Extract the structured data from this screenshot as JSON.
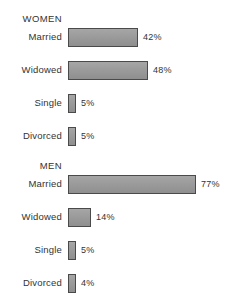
{
  "chart_data": {
    "type": "bar",
    "orientation": "horizontal",
    "title": "",
    "xlabel": "",
    "ylabel": "",
    "xlim": [
      0,
      100
    ],
    "grid": false,
    "legend": null,
    "value_suffix": "%",
    "groups": [
      {
        "name": "WOMEN",
        "categories": [
          "Married",
          "Widowed",
          "Single",
          "Divorced"
        ],
        "values": [
          42,
          48,
          5,
          5
        ],
        "labels": [
          "42%",
          "48%",
          "5%",
          "5%"
        ]
      },
      {
        "name": "MEN",
        "categories": [
          "Married",
          "Widowed",
          "Single",
          "Divorced"
        ],
        "values": [
          77,
          14,
          5,
          4
        ],
        "labels": [
          "77%",
          "14%",
          "5%",
          "4%"
        ]
      }
    ],
    "colors": {
      "bar_fill": "#9b9b9b",
      "bar_border": "#4a4a4a",
      "text": "#333333",
      "background": "#ffffff"
    }
  },
  "women": {
    "heading": "WOMEN",
    "rows": [
      {
        "label": "Married",
        "value": "42%"
      },
      {
        "label": "Widowed",
        "value": "48%"
      },
      {
        "label": "Single",
        "value": "5%"
      },
      {
        "label": "Divorced",
        "value": "5%"
      }
    ]
  },
  "men": {
    "heading": "MEN",
    "rows": [
      {
        "label": "Married",
        "value": "77%"
      },
      {
        "label": "Widowed",
        "value": "14%"
      },
      {
        "label": "Single",
        "value": "5%"
      },
      {
        "label": "Divorced",
        "value": "4%"
      }
    ]
  }
}
